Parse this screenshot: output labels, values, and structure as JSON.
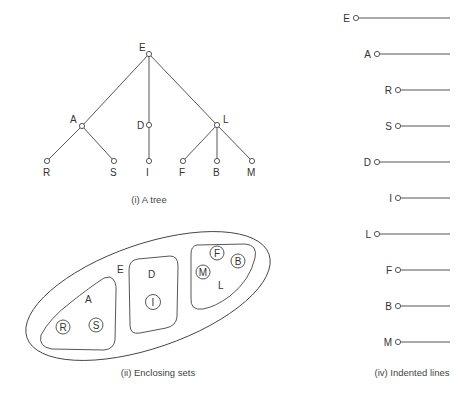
{
  "figures": {
    "tree": {
      "caption": "(i) A tree",
      "nodes": [
        {
          "id": "E",
          "label": "E",
          "x": 149,
          "y": 54,
          "lx": 139,
          "ly": 51
        },
        {
          "id": "A",
          "label": "A",
          "x": 82,
          "y": 126,
          "lx": 70,
          "ly": 123
        },
        {
          "id": "D",
          "label": "D",
          "x": 149,
          "y": 125,
          "lx": 137,
          "ly": 129
        },
        {
          "id": "L",
          "label": "L",
          "x": 217,
          "y": 125,
          "lx": 223,
          "ly": 123
        },
        {
          "id": "R",
          "label": "R",
          "x": 47,
          "y": 161,
          "lx": 43,
          "ly": 176
        },
        {
          "id": "S",
          "label": "S",
          "x": 114,
          "y": 161,
          "lx": 110,
          "ly": 176
        },
        {
          "id": "I",
          "label": "I",
          "x": 149,
          "y": 161,
          "lx": 146,
          "ly": 176
        },
        {
          "id": "F",
          "label": "F",
          "x": 183,
          "y": 161,
          "lx": 179,
          "ly": 176
        },
        {
          "id": "B",
          "label": "B",
          "x": 217,
          "y": 161,
          "lx": 213,
          "ly": 176
        },
        {
          "id": "M",
          "label": "M",
          "x": 252,
          "y": 161,
          "lx": 247,
          "ly": 176
        }
      ],
      "edges": [
        [
          "E",
          "A"
        ],
        [
          "E",
          "D"
        ],
        [
          "E",
          "L"
        ],
        [
          "A",
          "R"
        ],
        [
          "A",
          "S"
        ],
        [
          "D",
          "I"
        ],
        [
          "L",
          "F"
        ],
        [
          "L",
          "B"
        ],
        [
          "L",
          "M"
        ]
      ]
    },
    "enclosing_sets": {
      "caption": "(ii) Enclosing sets",
      "outer_label": "E",
      "groups": [
        {
          "label": "A",
          "members": [
            "R",
            "S"
          ]
        },
        {
          "label": "D",
          "members": [
            "I"
          ]
        },
        {
          "label": "L",
          "members": [
            "M",
            "F",
            "B"
          ]
        }
      ]
    },
    "indented_lines": {
      "caption": "(iv) Indented lines",
      "rows": [
        {
          "label": "E",
          "level": 0
        },
        {
          "label": "A",
          "level": 1
        },
        {
          "label": "R",
          "level": 2
        },
        {
          "label": "S",
          "level": 2
        },
        {
          "label": "D",
          "level": 1
        },
        {
          "label": "I",
          "level": 2
        },
        {
          "label": "L",
          "level": 1
        },
        {
          "label": "F",
          "level": 2
        },
        {
          "label": "B",
          "level": 2
        },
        {
          "label": "M",
          "level": 2
        }
      ]
    }
  }
}
